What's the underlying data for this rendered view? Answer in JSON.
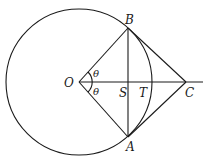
{
  "diagram": {
    "title": "",
    "points": {
      "O": {
        "label": "O",
        "x": 79,
        "y": 82
      },
      "B": {
        "label": "B",
        "x": 128,
        "y": 28
      },
      "A": {
        "label": "A",
        "x": 128,
        "y": 137
      },
      "C": {
        "label": "C",
        "x": 186,
        "y": 82
      },
      "S": {
        "label": "S",
        "x": 128,
        "y": 82
      },
      "T": {
        "label": "T",
        "x": 152,
        "y": 82
      }
    },
    "angle_labels": {
      "upper": "θ",
      "lower": "θ"
    },
    "circle": {
      "center": "O",
      "cx": 79,
      "cy": 82,
      "r": 73
    },
    "segments": [
      "OB",
      "OA",
      "BA",
      "BC",
      "AC",
      "OC-extended"
    ],
    "colors": {
      "ink": "#1a1a1a",
      "background": "#ffffff"
    }
  }
}
